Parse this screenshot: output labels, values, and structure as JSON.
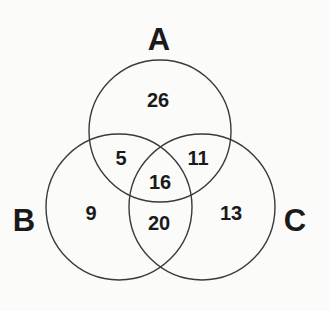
{
  "diagram": {
    "type": "venn",
    "colors": {
      "background": "#fbfbfa",
      "stroke": "#3a3a3a",
      "text": "#1a1a1a"
    },
    "sets": [
      {
        "id": "A",
        "label": "A",
        "cx": 160,
        "cy": 131,
        "r": 71,
        "label_x": 159,
        "label_y": 50
      },
      {
        "id": "B",
        "label": "B",
        "cx": 119,
        "cy": 207,
        "r": 73,
        "label_x": 24,
        "label_y": 231
      },
      {
        "id": "C",
        "label": "C",
        "cx": 202,
        "cy": 207,
        "r": 73,
        "label_x": 295,
        "label_y": 231
      }
    ],
    "regions": [
      {
        "id": "A_only",
        "sets": [
          "A"
        ],
        "value": "26",
        "x": 158,
        "y": 107
      },
      {
        "id": "A_and_B",
        "sets": [
          "A",
          "B"
        ],
        "value": "5",
        "x": 121,
        "y": 165
      },
      {
        "id": "A_and_C",
        "sets": [
          "A",
          "C"
        ],
        "value": "11",
        "x": 198,
        "y": 165
      },
      {
        "id": "A_and_B_and_C",
        "sets": [
          "A",
          "B",
          "C"
        ],
        "value": "16",
        "x": 160,
        "y": 189
      },
      {
        "id": "B_only",
        "sets": [
          "B"
        ],
        "value": "9",
        "x": 91,
        "y": 220
      },
      {
        "id": "B_and_C",
        "sets": [
          "B",
          "C"
        ],
        "value": "20",
        "x": 159,
        "y": 230
      },
      {
        "id": "C_only",
        "sets": [
          "C"
        ],
        "value": "13",
        "x": 231,
        "y": 220
      }
    ]
  }
}
